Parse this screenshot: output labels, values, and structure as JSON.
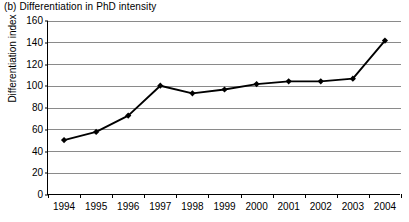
{
  "chart_data": {
    "type": "line",
    "title": "(b) Differentiation in PhD intensity",
    "subtitle": "",
    "xlabel": "",
    "ylabel": "Differentiation index",
    "categories": [
      "1994",
      "1995",
      "1996",
      "1997",
      "1998",
      "1999",
      "2000",
      "2001",
      "2002",
      "2003",
      "2004"
    ],
    "values": [
      50.5,
      58,
      73,
      100.5,
      93.5,
      97,
      102,
      104.5,
      104.5,
      107,
      142
    ],
    "series": [
      {
        "name": "Differentiation index",
        "values": [
          50.5,
          58,
          73,
          100.5,
          93.5,
          97,
          102,
          104.5,
          104.5,
          107,
          142
        ]
      }
    ],
    "ylim": [
      0,
      160
    ],
    "ytick_labels": [
      "0",
      "20",
      "40",
      "60",
      "80",
      "100",
      "120",
      "140",
      "160"
    ],
    "ytick_values": [
      0,
      20,
      40,
      60,
      80,
      100,
      120,
      140,
      160
    ],
    "grid": true,
    "grid_axis": "y",
    "legend": false,
    "legend_position": "none",
    "marker": "diamond",
    "line_color": "#000000",
    "marker_color": "#000000",
    "grid_color": "#8a8a8a",
    "axis_color": "#000000",
    "background_color": "#ffffff",
    "annotations": []
  }
}
